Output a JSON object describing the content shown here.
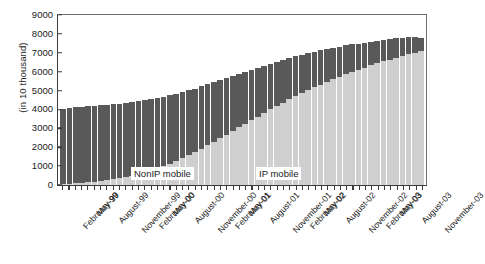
{
  "axes": {
    "ylabel": "(in 10 thousand)",
    "yticks": [
      0,
      1000,
      2000,
      3000,
      4000,
      5000,
      6000,
      7000,
      8000,
      9000
    ],
    "ymin": 0,
    "ymax": 9000,
    "xlabel": ""
  },
  "series_labels": {
    "nonip": "NonIP mobile",
    "ip": "IP mobile"
  },
  "colors": {
    "nonip": "#595959",
    "ip": "#cfcfcf",
    "axis": "#3b3b3b",
    "background": "#ffffff"
  },
  "xtick_labels": [
    "February-99",
    "May-99",
    "August-99",
    "November-99",
    "February-00",
    "May-00",
    "August-00",
    "November-00",
    "February-01",
    "May-01",
    "August-01",
    "November-01",
    "February-02",
    "May-02",
    "August-02",
    "November-02",
    "February-03",
    "May-03",
    "August-03",
    "November-03"
  ],
  "chart_data": {
    "type": "bar",
    "subtype": "stacked-vertical",
    "title": "",
    "xlabel": "",
    "ylabel": "(in 10 thousand)",
    "ylim": [
      0,
      9000
    ],
    "ytick_step": 1000,
    "grid": false,
    "legend_position": "in-plot-annotation",
    "categories": [
      "February-99",
      "March-99",
      "April-99",
      "May-99",
      "June-99",
      "July-99",
      "August-99",
      "September-99",
      "October-99",
      "November-99",
      "December-99",
      "January-00",
      "February-00",
      "March-00",
      "April-00",
      "May-00",
      "June-00",
      "July-00",
      "August-00",
      "September-00",
      "October-00",
      "November-00",
      "December-00",
      "January-01",
      "February-01",
      "March-01",
      "April-01",
      "May-01",
      "June-01",
      "July-01",
      "August-01",
      "September-01",
      "October-01",
      "November-01",
      "December-01",
      "January-02",
      "February-02",
      "March-02",
      "April-02",
      "May-02",
      "June-02",
      "July-02",
      "August-02",
      "September-02",
      "October-02",
      "November-02",
      "December-02",
      "January-03",
      "February-03",
      "March-03",
      "April-03",
      "May-03",
      "June-03",
      "July-03",
      "August-03",
      "September-03",
      "October-03",
      "November-03"
    ],
    "series": [
      {
        "name": "IP mobile",
        "color": "#cfcfcf",
        "stack_position": "bottom",
        "values": [
          40,
          60,
          85,
          110,
          140,
          175,
          215,
          260,
          310,
          365,
          430,
          500,
          580,
          670,
          770,
          880,
          1000,
          1130,
          1270,
          1420,
          1580,
          1750,
          1930,
          2110,
          2300,
          2480,
          2670,
          2860,
          3050,
          3240,
          3430,
          3620,
          3810,
          4000,
          4180,
          4360,
          4530,
          4700,
          4860,
          5020,
          5170,
          5320,
          5460,
          5600,
          5730,
          5860,
          5980,
          6100,
          6220,
          6330,
          6440,
          6540,
          6640,
          6730,
          6820,
          6910,
          7000,
          7090
        ]
      },
      {
        "name": "NonIP mobile",
        "color": "#595959",
        "stack_position": "top",
        "values": [
          4010,
          4030,
          4040,
          4030,
          4020,
          4010,
          4000,
          3980,
          3960,
          3940,
          3910,
          3880,
          3850,
          3810,
          3770,
          3720,
          3670,
          3610,
          3550,
          3490,
          3430,
          3360,
          3290,
          3220,
          3140,
          3070,
          2990,
          2910,
          2830,
          2750,
          2670,
          2590,
          2510,
          2430,
          2350,
          2270,
          2190,
          2110,
          2040,
          1960,
          1890,
          1810,
          1740,
          1670,
          1600,
          1530,
          1460,
          1390,
          1320,
          1260,
          1200,
          1140,
          1080,
          1030,
          980,
          900,
          810,
          710
        ]
      }
    ],
    "totals": [
      4050,
      4090,
      4125,
      4140,
      4160,
      4185,
      4215,
      4240,
      4270,
      4305,
      4340,
      4380,
      4430,
      4480,
      4540,
      4600,
      4670,
      4740,
      4820,
      4910,
      5010,
      5110,
      5220,
      5330,
      5440,
      5550,
      5660,
      5770,
      5880,
      5990,
      6100,
      6210,
      6320,
      6430,
      6530,
      6630,
      6720,
      6810,
      6900,
      6980,
      7060,
      7130,
      7200,
      7270,
      7330,
      7390,
      7440,
      7490,
      7540,
      7590,
      7640,
      7680,
      7720,
      7760,
      7800,
      7810,
      7810,
      7800
    ]
  }
}
